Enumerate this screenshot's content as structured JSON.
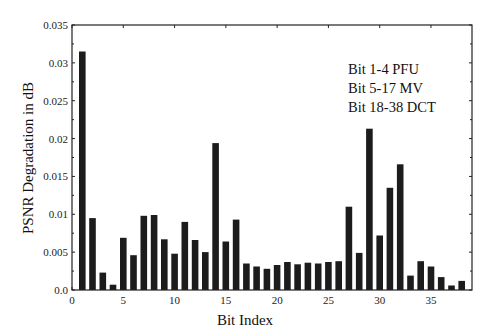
{
  "chart_data": {
    "type": "bar",
    "title": "",
    "xlabel": "Bit Index",
    "ylabel": "PSNR Degradation in dB",
    "xlim": [
      0,
      39
    ],
    "ylim": [
      0,
      0.035
    ],
    "grid": false,
    "xticks": [
      0,
      5,
      10,
      15,
      20,
      25,
      30,
      35
    ],
    "xtick_labels": [
      "0",
      "5",
      "10",
      "15",
      "20",
      "25",
      "30",
      "35"
    ],
    "yticks": [
      0,
      0.005,
      0.01,
      0.015,
      0.02,
      0.025,
      0.03,
      0.035
    ],
    "ytick_labels": [
      "0.0",
      "0.005",
      "0.01",
      "0.015",
      "0.02",
      "0.025",
      "0.03",
      "0.035"
    ],
    "annotations": [
      "Bit 1-4 PFU",
      "Bit 5-17 MV",
      "Bit 18-38 DCT"
    ],
    "categories": [
      1,
      2,
      3,
      4,
      5,
      6,
      7,
      8,
      9,
      10,
      11,
      12,
      13,
      14,
      15,
      16,
      17,
      18,
      19,
      20,
      21,
      22,
      23,
      24,
      25,
      26,
      27,
      28,
      29,
      30,
      31,
      32,
      33,
      34,
      35,
      36,
      37,
      38
    ],
    "values": [
      0.0315,
      0.0095,
      0.0023,
      0.0007,
      0.0069,
      0.0046,
      0.0098,
      0.0099,
      0.0067,
      0.0048,
      0.009,
      0.0066,
      0.005,
      0.0194,
      0.0064,
      0.0093,
      0.0035,
      0.0031,
      0.0028,
      0.0033,
      0.0037,
      0.0034,
      0.0036,
      0.0035,
      0.0037,
      0.0038,
      0.011,
      0.0049,
      0.0213,
      0.0072,
      0.0135,
      0.0166,
      0.0019,
      0.0038,
      0.0031,
      0.0017,
      0.0006,
      0.0012
    ]
  },
  "labels": {
    "xlabel": "Bit Index",
    "ylabel": "PSNR Degradation in dB",
    "legend_line1": "Bit 1-4 PFU",
    "legend_line2": "Bit 5-17 MV",
    "legend_line3": "Bit 18-38 DCT"
  },
  "colors": {
    "bar": "#1c1c1c",
    "axis": "#222222",
    "background": "#ffffff"
  }
}
